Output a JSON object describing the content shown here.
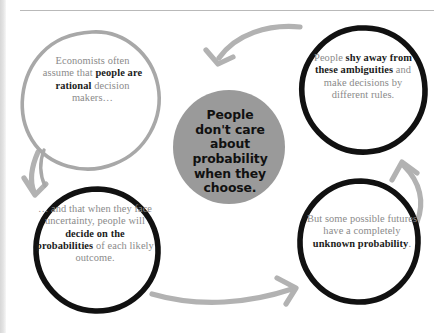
{
  "page": {
    "background_color": "#ffffff",
    "rule_color": "#b9b9b9",
    "edge_shadow_color": "#d7d7d7"
  },
  "diagram": {
    "type": "cycle-diagram",
    "center": {
      "name": "center-node",
      "fill_color": "#9a9a9a",
      "text_color": "#111111",
      "lines": [
        "People",
        "don't care",
        "about",
        "probability",
        "when they",
        "choose."
      ],
      "text": "People don't care about probability when they choose."
    },
    "nodes": [
      {
        "id": "top-left",
        "name": "node-economists-assume",
        "outline_color": "#a8a8a8",
        "outline_style": "hand-drawn",
        "text_color": "#8a8a8a",
        "emphasis_color": "#1b1b1b",
        "segments": [
          {
            "text": "Economists often assume that ",
            "bold": false
          },
          {
            "text": "people are rational",
            "bold": true
          },
          {
            "text": " decision makers…",
            "bold": false
          }
        ],
        "text": "Economists often assume that people are rational decision makers…"
      },
      {
        "id": "top-right",
        "name": "node-shy-away-ambiguities",
        "outline_color": "#111111",
        "outline_style": "hand-drawn",
        "text_color": "#8a8a8a",
        "emphasis_color": "#1b1b1b",
        "segments": [
          {
            "text": "People ",
            "bold": false
          },
          {
            "text": "shy away from these ambiguities",
            "bold": true
          },
          {
            "text": " and make decisions by different rules.",
            "bold": false
          }
        ],
        "text": "People shy away from these ambiguities and make decisions by different rules."
      },
      {
        "id": "bottom-left",
        "name": "node-decide-on-probabilities",
        "outline_color": "#111111",
        "outline_style": "hand-drawn",
        "text_color": "#8a8a8a",
        "emphasis_color": "#1b1b1b",
        "segments": [
          {
            "text": "… and that when they face uncertainty, people will ",
            "bold": false
          },
          {
            "text": "decide on the probabilities",
            "bold": true
          },
          {
            "text": " of each likely outcome.",
            "bold": false
          }
        ],
        "text": "… and that when they face uncertainty, people will decide on the probabilities of each likely outcome."
      },
      {
        "id": "bottom-right",
        "name": "node-unknown-probability",
        "outline_color": "#111111",
        "outline_style": "hand-drawn",
        "text_color": "#8a8a8a",
        "emphasis_color": "#1b1b1b",
        "segments": [
          {
            "text": "But some possible futures have a completely ",
            "bold": false
          },
          {
            "text": "unknown probability",
            "bold": true
          },
          {
            "text": ".",
            "bold": false
          }
        ],
        "text": "But some possible futures have a completely unknown probability."
      }
    ],
    "arrows": [
      {
        "name": "arrow-top-left-to-bottom-left",
        "from": "top-left",
        "to": "bottom-left",
        "color": "#b2b2b2",
        "direction": "down"
      },
      {
        "name": "arrow-bottom-left-to-bottom-right",
        "from": "bottom-left",
        "to": "bottom-right",
        "color": "#b2b2b2",
        "direction": "right"
      },
      {
        "name": "arrow-bottom-right-to-top-right",
        "from": "bottom-right",
        "to": "top-right",
        "color": "#b2b2b2",
        "direction": "up"
      },
      {
        "name": "arrow-top-right-to-center",
        "from": "top-right",
        "to": "center",
        "color": "#b2b2b2",
        "direction": "left-down"
      }
    ]
  }
}
